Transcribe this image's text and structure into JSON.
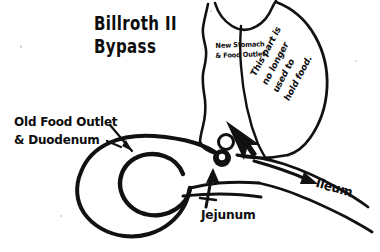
{
  "figure": {
    "title_line1": "Billroth II",
    "title_line2": "Bypass",
    "background_color": "#ffffff",
    "ink_color": "#111111"
  },
  "labels": {
    "title": "Billroth II\nBypass",
    "old_food_outlet": "Old Food Outlet\n& Duodenum",
    "new_stomach": "New Stomach\n& Food Outlet",
    "no_longer_used": "This part is\nno longer\nused to\nhold food.",
    "jejunum": "Jejunum",
    "ileum": "Ileum"
  },
  "anatomy": {
    "parts": [
      "esophagus",
      "gastric-pouch",
      "excluded-stomach",
      "duodenum-loop",
      "jejunum-limb",
      "ileum-limb",
      "anastomosis"
    ]
  },
  "arrows": {
    "old_food_outlet_pointer": "points down-right to duodenal loop",
    "jejunum_pointer": "points up to jejunal limb",
    "anastomosis_pointer": "points down-left to anastomosis",
    "ileum_flow": "points right along ileum showing food flow"
  }
}
